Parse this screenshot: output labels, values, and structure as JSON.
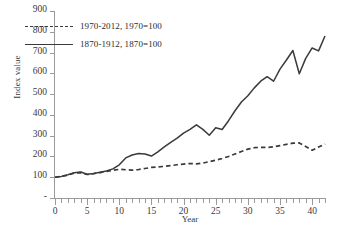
{
  "chart_data": {
    "type": "line",
    "title": "",
    "xlabel": "Year",
    "ylabel": "Index value",
    "xlim": [
      0,
      42
    ],
    "ylim": [
      0,
      900
    ],
    "grid": false,
    "legend_position": "upper-left-inside",
    "y_ticks": [
      0,
      100,
      200,
      300,
      400,
      500,
      600,
      700,
      800,
      900
    ],
    "y_tick_labels": [
      "-",
      "100",
      "200",
      "300",
      "400",
      "500",
      "600",
      "700",
      "800",
      "900"
    ],
    "x_ticks": [
      0,
      5,
      10,
      15,
      20,
      25,
      30,
      35,
      40
    ],
    "x_tick_labels": [
      "0",
      "5",
      "10",
      "15",
      "20",
      "25",
      "30",
      "35",
      "40"
    ],
    "x_minor_tick_step": 1,
    "x": [
      0,
      1,
      2,
      3,
      4,
      5,
      6,
      7,
      8,
      9,
      10,
      11,
      12,
      13,
      14,
      15,
      16,
      17,
      18,
      19,
      20,
      21,
      22,
      23,
      24,
      25,
      26,
      27,
      28,
      29,
      30,
      31,
      32,
      33,
      34,
      35,
      36,
      37,
      38,
      39,
      40,
      41,
      42
    ],
    "series": [
      {
        "name": "1970-2012, 1970=100",
        "style": "dashed",
        "color": "#3a3a3a",
        "values": [
          100,
          104,
          110,
          120,
          122,
          113,
          117,
          122,
          128,
          133,
          138,
          136,
          134,
          137,
          142,
          147,
          150,
          152,
          156,
          160,
          163,
          166,
          164,
          168,
          175,
          182,
          190,
          200,
          212,
          224,
          235,
          242,
          244,
          243,
          246,
          252,
          258,
          264,
          265,
          248,
          230,
          245,
          260
        ]
      },
      {
        "name": "1870-1912, 1870=100",
        "style": "solid",
        "color": "#3a3a3a",
        "values": [
          100,
          104,
          112,
          122,
          125,
          114,
          118,
          124,
          130,
          140,
          160,
          193,
          207,
          214,
          212,
          202,
          222,
          246,
          268,
          288,
          312,
          330,
          352,
          330,
          302,
          338,
          330,
          372,
          420,
          462,
          492,
          530,
          562,
          584,
          562,
          620,
          664,
          710,
          598,
          672,
          722,
          708,
          780
        ]
      }
    ]
  },
  "axis": {
    "y_title": "Index value",
    "x_title": "Year"
  },
  "legend": {
    "entries": [
      {
        "label": "1970-2012, 1970=100",
        "style": "dashed"
      },
      {
        "label": "1870-1912, 1870=100",
        "style": "solid"
      }
    ]
  },
  "caption": {
    "text": ""
  }
}
